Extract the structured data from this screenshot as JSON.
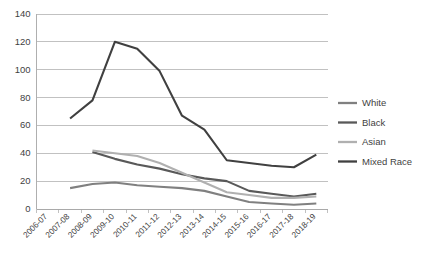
{
  "chart_data": {
    "type": "line",
    "title": "",
    "xlabel": "",
    "ylabel": "",
    "ylim": [
      0,
      140
    ],
    "ytick_step": 20,
    "yticks": [
      0,
      20,
      40,
      60,
      80,
      100,
      120,
      140
    ],
    "grid": "horizontal",
    "legend_position": "right",
    "categories": [
      "2006-07",
      "2007-08",
      "2008-09",
      "2009-10",
      "2010-11",
      "2011-12",
      "2012-13",
      "2013-14",
      "2014-15",
      "2015-16",
      "2016-17",
      "2017-18",
      "2018-19"
    ],
    "series": [
      {
        "name": "White",
        "color": "#808080",
        "values": [
          null,
          15,
          18,
          19,
          17,
          16,
          15,
          13,
          9,
          5,
          4,
          3,
          4
        ]
      },
      {
        "name": "Black",
        "color": "#595959",
        "values": [
          null,
          null,
          41,
          36,
          32,
          29,
          25,
          22,
          20,
          13,
          11,
          9,
          11
        ]
      },
      {
        "name": "Asian",
        "color": "#b0b0b0",
        "values": [
          null,
          null,
          42,
          40,
          38,
          33,
          26,
          19,
          12,
          10,
          8,
          8,
          9
        ]
      },
      {
        "name": "Mixed Race",
        "color": "#404040",
        "values": [
          null,
          65,
          78,
          120,
          115,
          99,
          67,
          57,
          35,
          33,
          31,
          30,
          39
        ]
      }
    ]
  },
  "legend": {
    "entries": [
      {
        "label": "White"
      },
      {
        "label": "Black"
      },
      {
        "label": "Asian"
      },
      {
        "label": "Mixed Race"
      }
    ]
  }
}
